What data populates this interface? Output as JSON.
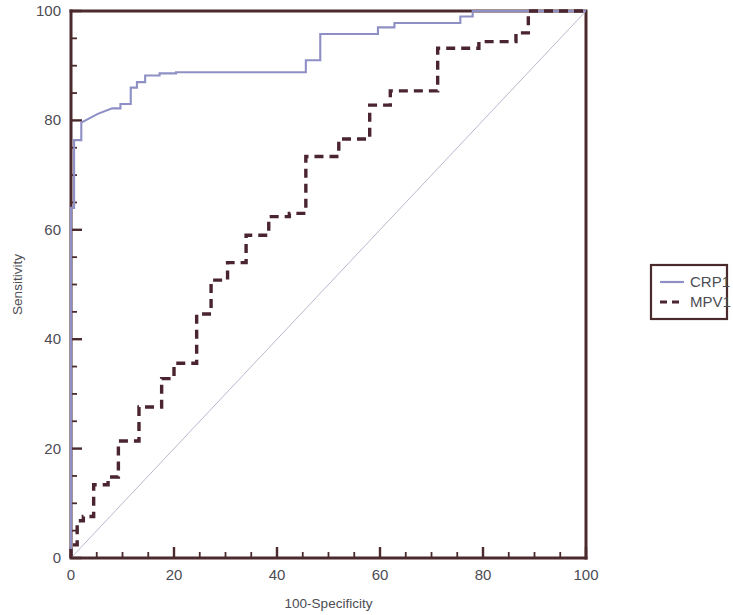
{
  "chart_data": {
    "type": "line",
    "title": "",
    "subtitle": "",
    "xlabel": "100-Specificity",
    "ylabel": "Sensitivity",
    "xlim": [
      0,
      100
    ],
    "ylim": [
      0,
      100
    ],
    "grid": false,
    "legend_position": "right",
    "x_ticks": [
      0,
      20,
      40,
      60,
      80,
      100
    ],
    "y_ticks": [
      0,
      20,
      40,
      60,
      80,
      100
    ],
    "x_tick_labels": [
      "0",
      "20",
      "40",
      "60",
      "80",
      "100"
    ],
    "y_tick_labels": [
      "0",
      "20",
      "40",
      "60",
      "80",
      "100"
    ],
    "x_minor_step": 5,
    "y_minor_step": 5,
    "reference_line": {
      "name": "diagonal-reference",
      "x": [
        0,
        100
      ],
      "y": [
        0,
        100
      ],
      "color": "#b9b9cf",
      "style": "solid"
    },
    "series": [
      {
        "name": "CRP1",
        "color": "#8e8fc4",
        "style": "solid",
        "x": [
          0,
          0,
          0.6,
          0.6,
          2.0,
          2.0,
          5.2,
          8.0,
          9.6,
          9.6,
          11.6,
          11.6,
          12.8,
          12.8,
          14.4,
          14.4,
          17.2,
          17.2,
          20.4,
          20.4,
          45.6,
          45.6,
          48.4,
          48.4,
          59.6,
          59.6,
          62.8,
          62.8,
          75.6,
          75.6,
          78.0,
          78.0,
          100
        ],
        "y": [
          0,
          64.0,
          64.0,
          76.4,
          76.4,
          79.6,
          81.2,
          82.2,
          82.2,
          83.0,
          83.0,
          86.0,
          86.0,
          87.0,
          87.0,
          88.2,
          88.2,
          88.6,
          88.6,
          88.8,
          88.8,
          91.0,
          91.0,
          95.8,
          95.8,
          97.0,
          97.0,
          97.8,
          97.8,
          99.0,
          99.0,
          100,
          100
        ]
      },
      {
        "name": "MPV1",
        "color": "#4a2530",
        "style": "dashed",
        "x": [
          0,
          0,
          1.2,
          1.2,
          2.4,
          2.4,
          4.4,
          4.4,
          7.2,
          7.2,
          9.2,
          9.2,
          13.2,
          13.2,
          17.6,
          17.6,
          20.0,
          20.0,
          24.4,
          24.4,
          27.2,
          27.2,
          30.4,
          30.4,
          34.0,
          34.0,
          38.4,
          38.4,
          42.4,
          42.4,
          45.6,
          45.6,
          52.0,
          52.0,
          58.0,
          58.0,
          62.0,
          62.0,
          71.2,
          71.2,
          79.2,
          79.2,
          86.4,
          86.4,
          88.8,
          88.8,
          100
        ],
        "y": [
          0,
          2.4,
          2.4,
          6.8,
          6.8,
          7.6,
          7.6,
          13.4,
          13.4,
          14.8,
          14.8,
          21.4,
          21.4,
          27.6,
          27.6,
          32.8,
          32.8,
          35.6,
          35.6,
          44.6,
          44.6,
          50.8,
          50.8,
          54.0,
          54.0,
          59.0,
          59.0,
          62.4,
          62.4,
          63.0,
          63.0,
          73.4,
          73.4,
          76.6,
          76.6,
          82.8,
          82.8,
          85.4,
          85.4,
          93.2,
          93.2,
          94.4,
          94.4,
          96.0,
          96.0,
          100,
          100
        ]
      }
    ],
    "legend": [
      {
        "label": "CRP1",
        "color": "#8e8fc4",
        "style": "solid"
      },
      {
        "label": "MPV1",
        "color": "#4a2530",
        "style": "dashed"
      }
    ]
  }
}
